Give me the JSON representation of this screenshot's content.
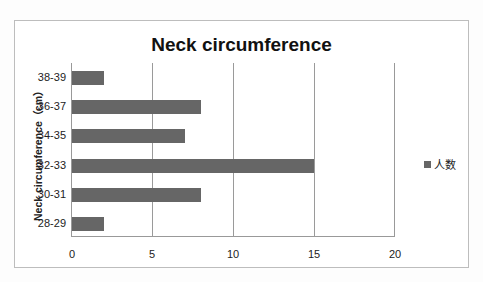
{
  "chart_data": {
    "type": "bar",
    "orientation": "horizontal",
    "title": "Neck circumference",
    "xlabel": "",
    "ylabel": "Neck circumference（cm）",
    "categories": [
      "28-29",
      "30-31",
      "32-33",
      "34-35",
      "36-37",
      "38-39"
    ],
    "series": [
      {
        "name": "人数",
        "values": [
          2,
          8,
          15,
          7,
          8,
          2
        ],
        "color": "#666666"
      }
    ],
    "xlim": [
      0,
      20
    ],
    "xticks": [
      "0",
      "5",
      "10",
      "15",
      "20"
    ],
    "grid": true,
    "legend_position": "right"
  },
  "legend": {
    "label": "人数"
  }
}
